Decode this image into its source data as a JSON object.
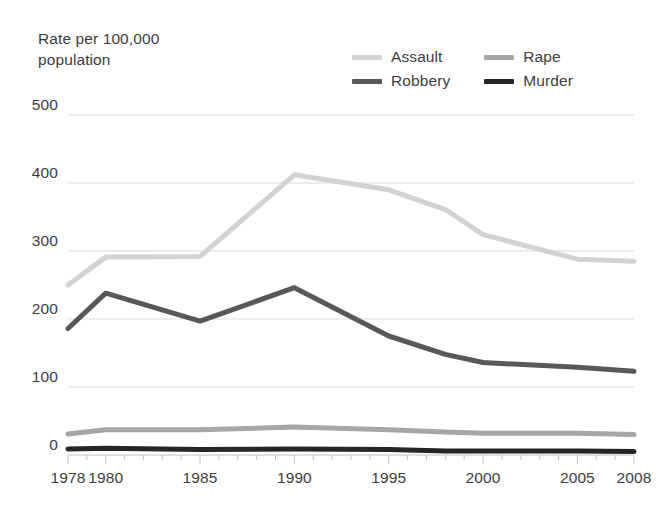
{
  "chart_data": {
    "type": "line",
    "title": "",
    "ylabel": "Rate per 100,000\npopulation",
    "xlabel": "",
    "ylim": [
      0,
      500
    ],
    "xlim": [
      1978,
      2008
    ],
    "grid": true,
    "legend_position": "top-right",
    "y_ticks": [
      "0",
      "100",
      "200",
      "300",
      "400",
      "500"
    ],
    "y_tick_values": [
      0,
      100,
      200,
      300,
      400,
      500
    ],
    "x_ticks": [
      "1978",
      "1980",
      "1985",
      "1990",
      "1995",
      "2000",
      "2005",
      "2008"
    ],
    "x_tick_values": [
      1978,
      1980,
      1985,
      1990,
      1995,
      2000,
      2005,
      2008
    ],
    "x_minor_ticks": [
      1979,
      1981,
      1982,
      1983,
      1984,
      1986,
      1987,
      1988,
      1989,
      1991,
      1992,
      1993,
      1994,
      1996,
      1997,
      1998,
      1999,
      2001,
      2002,
      2003,
      2004,
      2006,
      2007
    ],
    "series": [
      {
        "name": "Assault",
        "color": "#d2d2d2",
        "width": 5,
        "x": [
          1978,
          1980,
          1985,
          1990,
          1995,
          1998,
          2000,
          2005,
          2008
        ],
        "values": [
          250,
          291,
          292,
          412,
          390,
          361,
          324,
          288,
          285
        ]
      },
      {
        "name": "Rape",
        "color": "#a6a6a6",
        "width": 5,
        "x": [
          1978,
          1980,
          1985,
          1990,
          1995,
          1998,
          2000,
          2005,
          2008
        ],
        "values": [
          31,
          37,
          37,
          41,
          37,
          34,
          32,
          32,
          30
        ]
      },
      {
        "name": "Robbery",
        "color": "#585858",
        "width": 5,
        "x": [
          1978,
          1980,
          1985,
          1990,
          1995,
          1998,
          2000,
          2005,
          2008
        ],
        "values": [
          186,
          238,
          197,
          246,
          175,
          148,
          136,
          129,
          123
        ]
      },
      {
        "name": "Murder",
        "color": "#262626",
        "width": 5,
        "x": [
          1978,
          1980,
          1985,
          1990,
          1995,
          1998,
          2000,
          2005,
          2008
        ],
        "values": [
          9,
          10,
          8,
          9,
          8,
          6,
          6,
          6,
          5
        ]
      }
    ]
  },
  "legend": {
    "entries": [
      {
        "label": "Assault"
      },
      {
        "label": "Rape"
      },
      {
        "label": "Robbery"
      },
      {
        "label": "Murder"
      }
    ]
  },
  "colors": {
    "assault": "#d2d2d2",
    "rape": "#a6a6a6",
    "robbery": "#585858",
    "murder": "#262626",
    "gridline": "#d9d9d9",
    "text": "#3d3d3d",
    "background": "#ffffff"
  }
}
